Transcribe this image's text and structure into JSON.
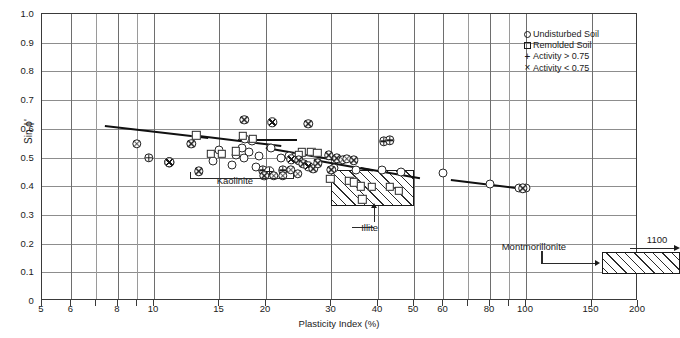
{
  "chart_data": {
    "type": "scatter",
    "title": "",
    "xlabel": "Plasticity Index (%)",
    "ylabel": "Sin ϕ'",
    "xscale": "log",
    "xlim": [
      5,
      200
    ],
    "ylim": [
      0,
      1.0
    ],
    "grid": true,
    "legend_position": "top-right",
    "xticks": [
      {
        "v": 5,
        "label": "5"
      },
      {
        "v": 6,
        "label": "6"
      },
      {
        "v": 7,
        "label": ""
      },
      {
        "v": 8,
        "label": "8"
      },
      {
        "v": 9,
        "label": ""
      },
      {
        "v": 10,
        "label": "10"
      },
      {
        "v": 15,
        "label": "15"
      },
      {
        "v": 20,
        "label": "20"
      },
      {
        "v": 30,
        "label": "30"
      },
      {
        "v": 40,
        "label": "40"
      },
      {
        "v": 50,
        "label": "50"
      },
      {
        "v": 60,
        "label": "60"
      },
      {
        "v": 70,
        "label": ""
      },
      {
        "v": 80,
        "label": "80"
      },
      {
        "v": 90,
        "label": ""
      },
      {
        "v": 100,
        "label": "100"
      },
      {
        "v": 150,
        "label": "150"
      },
      {
        "v": 200,
        "label": "200"
      }
    ],
    "yticks": [
      {
        "v": 0.0,
        "label": "0"
      },
      {
        "v": 0.1,
        "label": "0.1"
      },
      {
        "v": 0.2,
        "label": "0.2"
      },
      {
        "v": 0.3,
        "label": "0.3"
      },
      {
        "v": 0.4,
        "label": "0.4"
      },
      {
        "v": 0.5,
        "label": "0.5"
      },
      {
        "v": 0.6,
        "label": "0.6"
      },
      {
        "v": 0.7,
        "label": "0.7"
      },
      {
        "v": 0.8,
        "label": "0.8"
      },
      {
        "v": 0.9,
        "label": "0.9"
      },
      {
        "v": 1.0,
        "label": "1.0"
      }
    ],
    "legend": [
      {
        "marker": "circle",
        "label": "Undisturbed Soil"
      },
      {
        "marker": "square",
        "label": "Remolded Soil"
      },
      {
        "marker": "plus",
        "label": "Activity > 0.75"
      },
      {
        "marker": "cross",
        "label": "Activity < 0.75"
      }
    ],
    "series": [
      {
        "name": "Undisturbed Soil",
        "marker": "circle",
        "points": [
          [
            17.6,
            0.565
          ],
          [
            18.3,
            0.556
          ],
          [
            17.2,
            0.533
          ],
          [
            18.0,
            0.52
          ],
          [
            16.6,
            0.508
          ],
          [
            17.5,
            0.497
          ],
          [
            19.2,
            0.505
          ],
          [
            20.6,
            0.534
          ],
          [
            15.0,
            0.525
          ],
          [
            14.4,
            0.487
          ],
          [
            16.2,
            0.475
          ],
          [
            18.8,
            0.468
          ],
          [
            22.0,
            0.497
          ],
          [
            23.0,
            0.505
          ],
          [
            35.0,
            0.456
          ],
          [
            41.0,
            0.455
          ],
          [
            46.0,
            0.448
          ],
          [
            60.0,
            0.447
          ],
          [
            80.0,
            0.408
          ],
          [
            96.0,
            0.392
          ],
          [
            100.0,
            0.392
          ],
          [
            30.5,
            0.465
          ]
        ]
      },
      {
        "name": "Remolded Soil",
        "marker": "square",
        "points": [
          [
            13.0,
            0.578
          ],
          [
            17.3,
            0.575
          ],
          [
            18.4,
            0.566
          ],
          [
            16.6,
            0.522
          ],
          [
            15.2,
            0.512
          ],
          [
            14.2,
            0.513
          ],
          [
            25.0,
            0.518
          ],
          [
            26.5,
            0.52
          ],
          [
            27.5,
            0.516
          ],
          [
            24.5,
            0.508
          ],
          [
            36.0,
            0.399
          ],
          [
            38.5,
            0.397
          ],
          [
            36.3,
            0.355
          ],
          [
            33.5,
            0.418
          ],
          [
            34.5,
            0.413
          ],
          [
            43.0,
            0.398
          ],
          [
            45.5,
            0.385
          ],
          [
            29.8,
            0.425
          ]
        ]
      },
      {
        "name": "Activity > 0.75",
        "marker": "plus",
        "points": [
          [
            9.7,
            0.498
          ],
          [
            11.0,
            0.483
          ],
          [
            19.6,
            0.455
          ],
          [
            20.4,
            0.452
          ],
          [
            22.2,
            0.455
          ],
          [
            41.5,
            0.556
          ],
          [
            43.0,
            0.56
          ]
        ]
      },
      {
        "name": "Activity < 0.75",
        "marker": "cross",
        "points": [
          [
            9.0,
            0.548
          ],
          [
            12.6,
            0.548
          ],
          [
            17.5,
            0.632
          ],
          [
            20.8,
            0.622
          ],
          [
            11.0,
            0.483
          ],
          [
            13.2,
            0.452
          ],
          [
            26.0,
            0.618
          ],
          [
            29.5,
            0.507
          ],
          [
            23.4,
            0.494
          ],
          [
            24.5,
            0.49
          ],
          [
            25.2,
            0.478
          ],
          [
            19.8,
            0.437
          ],
          [
            21.0,
            0.437
          ],
          [
            22.2,
            0.437
          ],
          [
            23.3,
            0.457
          ],
          [
            24.4,
            0.444
          ],
          [
            26.0,
            0.47
          ],
          [
            26.8,
            0.46
          ],
          [
            27.6,
            0.48
          ],
          [
            31.0,
            0.497
          ],
          [
            32.2,
            0.492
          ],
          [
            33.0,
            0.495
          ],
          [
            34.5,
            0.49
          ],
          [
            98.0,
            0.393
          ],
          [
            30.0,
            0.458
          ]
        ]
      }
    ],
    "trend_lines": [
      {
        "name": "segment-1",
        "x": [
          7.4,
          14.0
        ],
        "y": [
          0.612,
          0.57
        ]
      },
      {
        "name": "segment-2",
        "x": [
          13.2,
          22.0
        ],
        "y": [
          0.58,
          0.545
        ]
      },
      {
        "name": "segment-3",
        "x": [
          16.8,
          24.2
        ],
        "y": [
          0.563,
          0.563
        ]
      },
      {
        "name": "segment-4",
        "x": [
          20.0,
          31.0
        ],
        "y": [
          0.538,
          0.495
        ]
      },
      {
        "name": "segment-5",
        "x": [
          27.0,
          39.0
        ],
        "y": [
          0.495,
          0.458
        ]
      },
      {
        "name": "segment-6",
        "x": [
          36.0,
          52.0
        ],
        "y": [
          0.468,
          0.432
        ]
      },
      {
        "name": "segment-7",
        "x": [
          63.0,
          100.0
        ],
        "y": [
          0.425,
          0.393
        ]
      }
    ],
    "regions": [
      {
        "name": "Illite",
        "x": [
          30.0,
          50.0
        ],
        "y": [
          0.33,
          0.455
        ],
        "hatched": true
      },
      {
        "name": "Montmorillonite",
        "x": [
          160.0,
          260.0
        ],
        "y": [
          0.095,
          0.17
        ],
        "hatched": true
      }
    ],
    "annotations": [
      {
        "name": "kaolinite-label",
        "text": "Kaolinite",
        "x": 16.5,
        "y": 0.42
      },
      {
        "name": "illite-label",
        "text": "Illite",
        "x": 38.0,
        "y": 0.258
      },
      {
        "name": "montmorillonite-label",
        "text": "Montmorillonite",
        "x": 105.0,
        "y": 0.19
      },
      {
        "name": "value-1100-label",
        "text": "1100",
        "x": 225.0,
        "y": 0.215
      }
    ],
    "kaolinite_range_x": [
      12.5,
      23.5
    ],
    "montmorillonite_overflow_value": 1100
  }
}
